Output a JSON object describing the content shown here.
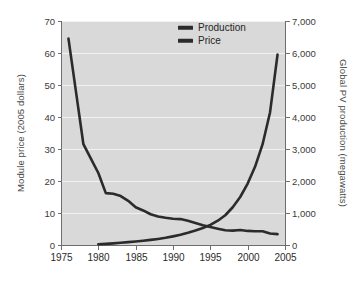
{
  "chart_data": {
    "type": "line",
    "title": "",
    "subtitle": "",
    "xlabel": "",
    "ylabel": "Module price (2005 dollars)",
    "y2label": "Global PV production (megawatts)",
    "grid": true,
    "legend_position": "top-right",
    "xlim": [
      1975,
      2005
    ],
    "ylim": [
      0,
      70
    ],
    "y2lim": [
      0,
      7000
    ],
    "x_ticks": [
      1975,
      1980,
      1985,
      1990,
      1995,
      2000,
      2005
    ],
    "x_tick_labels": [
      "1975",
      "1980",
      "1985",
      "1990",
      "1995",
      "2000",
      "2005"
    ],
    "y_ticks": [
      0,
      10,
      20,
      30,
      40,
      50,
      60,
      70
    ],
    "y_tick_labels": [
      "0",
      "10",
      "20",
      "30",
      "40",
      "50",
      "60",
      "70"
    ],
    "y2_ticks": [
      0,
      1000,
      2000,
      3000,
      4000,
      5000,
      6000,
      7000
    ],
    "y2_tick_labels": [
      "0",
      "1,000",
      "2,000",
      "3,000",
      "4,000",
      "5,000",
      "6,000",
      "7,000"
    ],
    "series": [
      {
        "name": "Price",
        "axis": "left",
        "color": "#2b2b2b",
        "x": [
          1976,
          1977,
          1978,
          1979,
          1980,
          1981,
          1982,
          1983,
          1984,
          1985,
          1986,
          1987,
          1988,
          1989,
          1990,
          1991,
          1992,
          1993,
          1994,
          1995,
          1996,
          1997,
          1998,
          1999,
          2000,
          2001,
          2002,
          2003,
          2004
        ],
        "values": [
          64.5,
          48.0,
          31.5,
          27.0,
          22.5,
          16.2,
          16.0,
          15.3,
          13.8,
          11.8,
          10.8,
          9.6,
          8.9,
          8.5,
          8.2,
          8.1,
          7.6,
          6.9,
          6.2,
          5.6,
          5.1,
          4.6,
          4.5,
          4.7,
          4.4,
          4.3,
          4.3,
          3.6,
          3.4
        ]
      },
      {
        "name": "Production",
        "axis": "right",
        "color": "#2b2b2b",
        "x": [
          1980,
          1981,
          1982,
          1983,
          1984,
          1985,
          1986,
          1987,
          1988,
          1989,
          1990,
          1991,
          1992,
          1993,
          1994,
          1995,
          1996,
          1997,
          1998,
          1999,
          2000,
          2001,
          2002,
          2003,
          2004
        ],
        "values": [
          25,
          35,
          50,
          70,
          90,
          110,
          135,
          160,
          190,
          225,
          270,
          320,
          380,
          450,
          530,
          630,
          760,
          930,
          1180,
          1500,
          1920,
          2450,
          3150,
          4150,
          5950
        ]
      }
    ]
  },
  "legend": {
    "items": [
      {
        "label": "Production",
        "color": "#2b2b2b"
      },
      {
        "label": "Price",
        "color": "#2b2b2b"
      }
    ]
  }
}
